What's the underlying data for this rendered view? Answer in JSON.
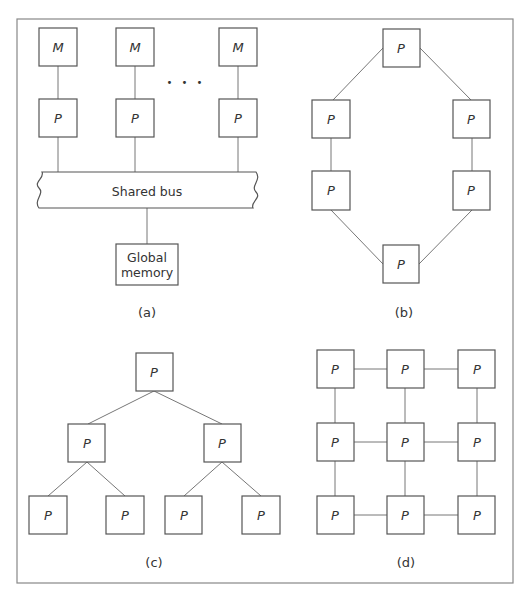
{
  "figure": {
    "panels": [
      {
        "id": "a",
        "caption": "(a)",
        "title": "Shared bus architecture",
        "memory_label": "M",
        "processor_label": "P",
        "ellipsis": "• • •",
        "bus_label": "Shared bus",
        "global_memory_line1": "Global",
        "global_memory_line2": "memory"
      },
      {
        "id": "b",
        "caption": "(b)",
        "title": "Ring",
        "node_label": "P"
      },
      {
        "id": "c",
        "caption": "(c)",
        "title": "Binary tree",
        "node_label": "P"
      },
      {
        "id": "d",
        "caption": "(d)",
        "title": "2D mesh",
        "node_label": "P"
      }
    ],
    "colors": {
      "stroke": "#555555",
      "edge": "#777777",
      "text": "#333333",
      "background": "#ffffff"
    }
  }
}
